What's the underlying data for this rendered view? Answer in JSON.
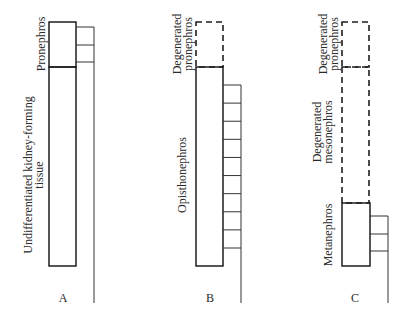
{
  "diagram": {
    "title": "",
    "panels": [
      {
        "id": "A",
        "letter": "A",
        "labels": {
          "pronephros": "Pronephros",
          "tissue_line1": "Undifferentiated kidney-forming",
          "tissue_line2": "tissue"
        },
        "tubule_segments": 2
      },
      {
        "id": "B",
        "letter": "B",
        "labels": {
          "degen_line1": "Degenerated",
          "degen_line2": "pronephros",
          "main": "Opisthonephros"
        },
        "tubule_segments": 9
      },
      {
        "id": "C",
        "letter": "C",
        "labels": {
          "degen_pro_line1": "Degenerated",
          "degen_pro_line2": "pronephros",
          "degen_meso_line1": "Degenerated",
          "degen_meso_line2": "mesonephros",
          "main": "Metanephros"
        },
        "tubule_segments": 2
      }
    ],
    "colors": {
      "line": "#1e1e1e",
      "background": "#ffffff"
    }
  }
}
